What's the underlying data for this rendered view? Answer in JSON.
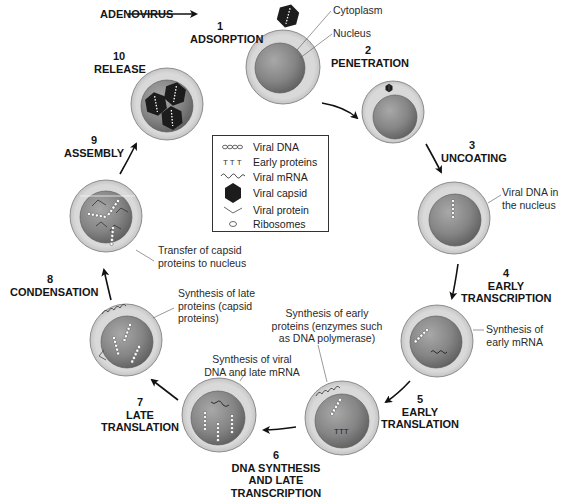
{
  "figure": {
    "virus_label": "ADENOVIRUS",
    "steps": [
      {
        "number": "1",
        "label": "ADSORPTION"
      },
      {
        "number": "2",
        "label": "PENETRATION"
      },
      {
        "number": "3",
        "label": "UNCOATING"
      },
      {
        "number": "4",
        "label_line1": "EARLY",
        "label_line2": "TRANSCRIPTION"
      },
      {
        "number": "5",
        "label_line1": "EARLY",
        "label_line2": "TRANSLATION"
      },
      {
        "number": "6",
        "label_line1": "DNA SYNTHESIS",
        "label_line2": "AND LATE",
        "label_line3": "TRANSCRIPTION"
      },
      {
        "number": "7",
        "label_line1": "LATE",
        "label_line2": "TRANSLATION"
      },
      {
        "number": "8",
        "label": "CONDENSATION"
      },
      {
        "number": "9",
        "label": "ASSEMBLY"
      },
      {
        "number": "10",
        "label": "RELEASE"
      }
    ],
    "annotations": {
      "cytoplasm": "Cytoplasm",
      "nucleus": "Nucleus",
      "viral_dna_nucleus_l1": "Viral DNA in",
      "viral_dna_nucleus_l2": "the nucleus",
      "early_mrna_l1": "Synthesis of",
      "early_mrna_l2": "early mRNA",
      "early_proteins_l1": "Synthesis of early",
      "early_proteins_l2": "proteins (enzymes such",
      "early_proteins_l3": "as DNA polymerase)",
      "viral_dna_late_l1": "Synthesis of viral",
      "viral_dna_late_l2": "DNA and late mRNA",
      "late_proteins_l1": "Synthesis of late",
      "late_proteins_l2": "proteins (capsid",
      "late_proteins_l3": "proteins)",
      "transfer_l1": "Transfer of capsid",
      "transfer_l2": "proteins to nucleus"
    },
    "legend": [
      {
        "icon": "viral-dna-icon",
        "label": "Viral DNA"
      },
      {
        "icon": "early-proteins-icon",
        "label": "Early proteins"
      },
      {
        "icon": "viral-mrna-icon",
        "label": "Viral mRNA"
      },
      {
        "icon": "viral-capsid-icon",
        "label": "Viral capsid"
      },
      {
        "icon": "viral-protein-icon",
        "label": "Viral protein"
      },
      {
        "icon": "ribosome-icon",
        "label": "Ribosomes"
      }
    ],
    "colors": {
      "cytoplasm": "#d6d6d6",
      "nucleus": "#8a8a8a",
      "capsid": "#1c1c1c",
      "text": "#151515"
    }
  }
}
